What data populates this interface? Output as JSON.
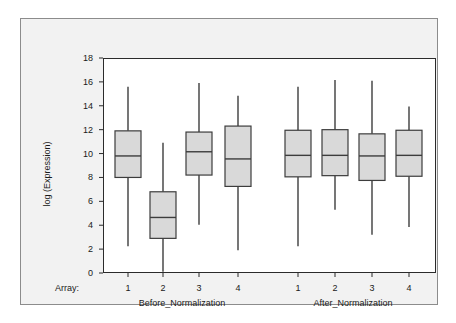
{
  "chart_data": {
    "type": "box",
    "title": "",
    "xlabel": "Array:",
    "ylabel": "log (Expression)",
    "ylim": [
      0,
      18
    ],
    "yticks": [
      0,
      2,
      4,
      6,
      8,
      10,
      12,
      14,
      16,
      18
    ],
    "grid": false,
    "legend": "none",
    "group_labels": [
      "Before_Normalization",
      "After_Normalization"
    ],
    "categories": [
      "1",
      "2",
      "3",
      "4",
      "1",
      "2",
      "3",
      "4"
    ],
    "boxes": [
      {
        "group": "Before_Normalization",
        "array": "1",
        "whisker_low": 2.25,
        "q1": 8.0,
        "median": 9.8,
        "q3": 11.9,
        "whisker_high": 15.6
      },
      {
        "group": "Before_Normalization",
        "array": "2",
        "whisker_low": 0.1,
        "q1": 2.9,
        "median": 4.65,
        "q3": 6.8,
        "whisker_high": 10.9
      },
      {
        "group": "Before_Normalization",
        "array": "3",
        "whisker_low": 4.05,
        "q1": 8.2,
        "median": 10.15,
        "q3": 11.8,
        "whisker_high": 15.9
      },
      {
        "group": "Before_Normalization",
        "array": "4",
        "whisker_low": 1.9,
        "q1": 7.25,
        "median": 9.55,
        "q3": 12.3,
        "whisker_high": 14.85
      },
      {
        "group": "After_Normalization",
        "array": "1",
        "whisker_low": 2.25,
        "q1": 8.05,
        "median": 9.85,
        "q3": 11.95,
        "whisker_high": 15.6
      },
      {
        "group": "After_Normalization",
        "array": "2",
        "whisker_low": 5.3,
        "q1": 8.15,
        "median": 9.85,
        "q3": 12.0,
        "whisker_high": 16.15
      },
      {
        "group": "After_Normalization",
        "array": "3",
        "whisker_low": 3.2,
        "q1": 7.75,
        "median": 9.8,
        "q3": 11.65,
        "whisker_high": 16.1
      },
      {
        "group": "After_Normalization",
        "array": "4",
        "whisker_low": 3.85,
        "q1": 8.1,
        "median": 9.85,
        "q3": 11.95,
        "whisker_high": 13.95
      }
    ],
    "colors": {
      "box_fill": "#d9d9d9",
      "box_stroke": "#3d3d3d",
      "whisker": "#3d3d3d",
      "axis": "#2b2b2b",
      "panel_bg": "#f2f2f2",
      "plot_bg": "#ffffff",
      "panel_border": "#8c8c8c",
      "text": "#1a1a1a"
    }
  },
  "axis": {
    "y_label": "log (Expression)",
    "y_ticks": [
      "18",
      "16",
      "14",
      "12",
      "10",
      "8",
      "6",
      "4",
      "2",
      "0"
    ],
    "x_prefix": "Array:",
    "x_ticks": [
      "1",
      "2",
      "3",
      "4",
      "1",
      "2",
      "3",
      "4"
    ],
    "groups": [
      "Before_Normalization",
      "After_Normalization"
    ]
  }
}
